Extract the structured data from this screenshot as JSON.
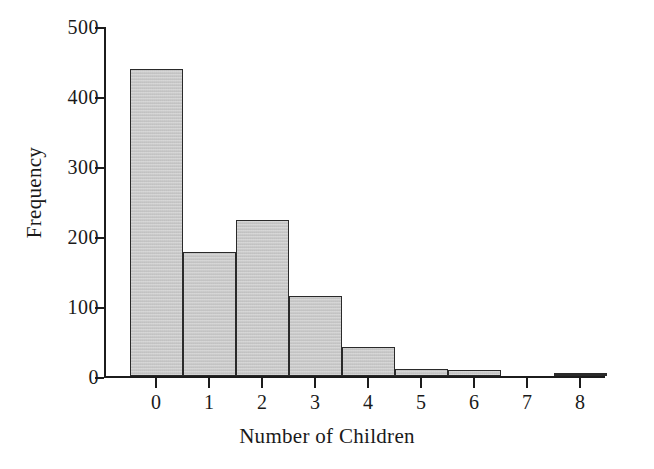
{
  "chart_data": {
    "type": "bar",
    "title": "",
    "subtitle": "",
    "xlabel": "Number of Children",
    "ylabel": "Frequency",
    "categories": [
      "0",
      "1",
      "2",
      "3",
      "4",
      "5",
      "6",
      "7",
      "8"
    ],
    "values": [
      438,
      177,
      223,
      114,
      41,
      10,
      9,
      0,
      3
    ],
    "series": [
      {
        "name": "Frequency",
        "values": [
          438,
          177,
          223,
          114,
          41,
          10,
          9,
          0,
          3
        ]
      }
    ],
    "xlim": [
      -0.5,
      8.5
    ],
    "ylim": [
      0,
      500
    ],
    "ytick_labels": [
      "0",
      "100",
      "200",
      "300",
      "400",
      "500"
    ],
    "ytick_values": [
      0,
      100,
      200,
      300,
      400,
      500
    ],
    "xtick_labels": [
      "0",
      "1",
      "2",
      "3",
      "4",
      "5",
      "6",
      "7",
      "8"
    ],
    "grid": false,
    "legend": "none",
    "bar_fill_color": "#c9c9c9",
    "bar_edge_color": "#2a2a2a",
    "axis_color": "#1c1c1c",
    "background_color": "#ffffff"
  }
}
